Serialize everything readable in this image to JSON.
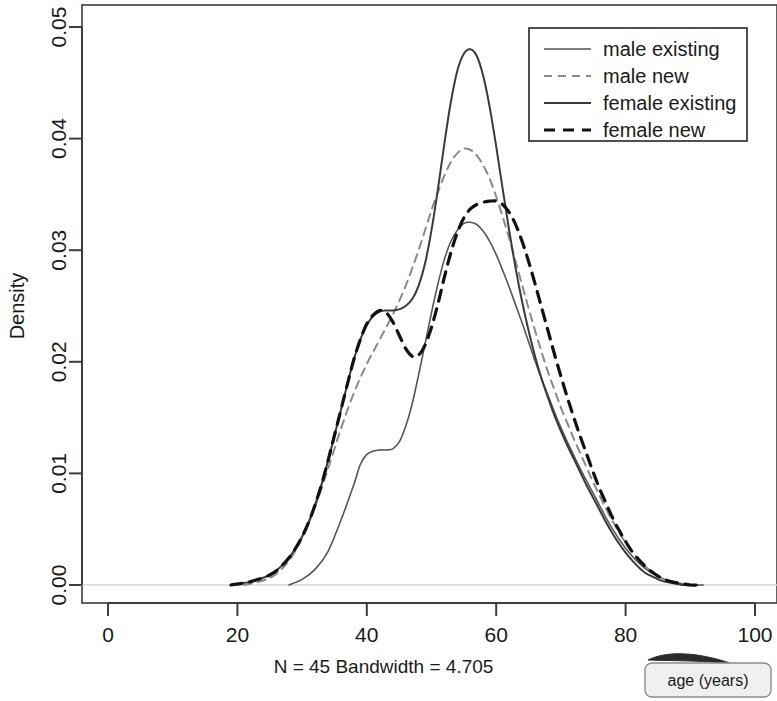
{
  "chart_data": {
    "type": "line",
    "title": "",
    "subtitle": "N = 45   Bandwidth = 4.705",
    "xlabel": "",
    "ylabel": "Density",
    "xlim": [
      0,
      100
    ],
    "ylim": [
      0.0,
      0.05
    ],
    "xticks": [
      0,
      20,
      40,
      60,
      80,
      100
    ],
    "xtick_labels": [
      "0",
      "20",
      "40",
      "60",
      "80",
      "100"
    ],
    "yticks": [
      0.0,
      0.01,
      0.02,
      0.03,
      0.04,
      0.05
    ],
    "ytick_labels": [
      "0.00",
      "0.01",
      "0.02",
      "0.03",
      "0.04",
      "0.05"
    ],
    "grid": false,
    "legend_position": "top-right",
    "series": [
      {
        "name": "male existing",
        "style": "solid",
        "color": "#555555",
        "width": 1.6,
        "points": [
          [
            28,
            0.0
          ],
          [
            30,
            0.0005
          ],
          [
            32,
            0.0014
          ],
          [
            34,
            0.003
          ],
          [
            36,
            0.0058
          ],
          [
            38,
            0.009
          ],
          [
            39,
            0.0108
          ],
          [
            40,
            0.0117
          ],
          [
            41,
            0.012
          ],
          [
            42,
            0.0121
          ],
          [
            43,
            0.0121
          ],
          [
            44,
            0.0122
          ],
          [
            45,
            0.0128
          ],
          [
            46,
            0.0142
          ],
          [
            47,
            0.0162
          ],
          [
            48,
            0.0188
          ],
          [
            49,
            0.0216
          ],
          [
            50,
            0.0244
          ],
          [
            51,
            0.027
          ],
          [
            52,
            0.0292
          ],
          [
            53,
            0.0308
          ],
          [
            54,
            0.0318
          ],
          [
            55,
            0.0324
          ],
          [
            56,
            0.0325
          ],
          [
            57,
            0.0323
          ],
          [
            58,
            0.0317
          ],
          [
            59,
            0.0308
          ],
          [
            60,
            0.0296
          ],
          [
            61,
            0.0282
          ],
          [
            62,
            0.0267
          ],
          [
            63,
            0.0251
          ],
          [
            64,
            0.0235
          ],
          [
            65,
            0.0218
          ],
          [
            66,
            0.0201
          ],
          [
            67,
            0.0185
          ],
          [
            68,
            0.017
          ],
          [
            69,
            0.0155
          ],
          [
            70,
            0.0141
          ],
          [
            71,
            0.0128
          ],
          [
            72,
            0.0116
          ],
          [
            73,
            0.0104
          ],
          [
            74,
            0.0093
          ],
          [
            75,
            0.0082
          ],
          [
            76,
            0.0071
          ],
          [
            77,
            0.006
          ],
          [
            78,
            0.005
          ],
          [
            79,
            0.0041
          ],
          [
            80,
            0.0033
          ],
          [
            81,
            0.0026
          ],
          [
            82,
            0.002
          ],
          [
            83,
            0.0015
          ],
          [
            84,
            0.0011
          ],
          [
            85,
            0.0008
          ],
          [
            86,
            0.0005
          ],
          [
            87,
            0.0003
          ],
          [
            88,
            0.0002
          ],
          [
            90,
            0.0
          ],
          [
            92,
            0.0
          ]
        ]
      },
      {
        "name": "male new",
        "style": "dashed",
        "color": "#8a8a8a",
        "width": 2.0,
        "points": [
          [
            21,
            0.0
          ],
          [
            24,
            0.0004
          ],
          [
            26,
            0.001
          ],
          [
            28,
            0.0022
          ],
          [
            30,
            0.0042
          ],
          [
            32,
            0.007
          ],
          [
            34,
            0.0104
          ],
          [
            36,
            0.014
          ],
          [
            38,
            0.0172
          ],
          [
            40,
            0.0198
          ],
          [
            42,
            0.022
          ],
          [
            44,
            0.0242
          ],
          [
            46,
            0.0268
          ],
          [
            48,
            0.03
          ],
          [
            50,
            0.0336
          ],
          [
            51,
            0.0352
          ],
          [
            52,
            0.0367
          ],
          [
            53,
            0.0379
          ],
          [
            54,
            0.0387
          ],
          [
            55,
            0.0391
          ],
          [
            56,
            0.039
          ],
          [
            57,
            0.0385
          ],
          [
            58,
            0.0376
          ],
          [
            59,
            0.0364
          ],
          [
            60,
            0.0348
          ],
          [
            61,
            0.033
          ],
          [
            62,
            0.0311
          ],
          [
            63,
            0.029
          ],
          [
            64,
            0.0269
          ],
          [
            65,
            0.0248
          ],
          [
            66,
            0.0228
          ],
          [
            67,
            0.0209
          ],
          [
            68,
            0.0191
          ],
          [
            69,
            0.0175
          ],
          [
            70,
            0.0159
          ],
          [
            71,
            0.0145
          ],
          [
            72,
            0.0131
          ],
          [
            73,
            0.0118
          ],
          [
            74,
            0.0105
          ],
          [
            75,
            0.0092
          ],
          [
            76,
            0.008
          ],
          [
            77,
            0.0068
          ],
          [
            78,
            0.0057
          ],
          [
            79,
            0.0047
          ],
          [
            80,
            0.0038
          ],
          [
            81,
            0.003
          ],
          [
            82,
            0.0023
          ],
          [
            83,
            0.0017
          ],
          [
            84,
            0.0012
          ],
          [
            85,
            0.0008
          ],
          [
            86,
            0.0005
          ],
          [
            87,
            0.0003
          ],
          [
            88,
            0.0002
          ],
          [
            90,
            0.0
          ],
          [
            91,
            0.0
          ]
        ]
      },
      {
        "name": "female existing",
        "style": "solid",
        "color": "#3a3a3a",
        "width": 2.0,
        "points": [
          [
            19,
            0.0
          ],
          [
            22,
            0.0003
          ],
          [
            25,
            0.0009
          ],
          [
            27,
            0.0018
          ],
          [
            29,
            0.0033
          ],
          [
            31,
            0.0056
          ],
          [
            33,
            0.009
          ],
          [
            35,
            0.0134
          ],
          [
            37,
            0.018
          ],
          [
            38,
            0.0202
          ],
          [
            39,
            0.022
          ],
          [
            40,
            0.0233
          ],
          [
            41,
            0.0241
          ],
          [
            42,
            0.0245
          ],
          [
            43,
            0.0246
          ],
          [
            44,
            0.0246
          ],
          [
            45,
            0.0247
          ],
          [
            46,
            0.025
          ],
          [
            47,
            0.0256
          ],
          [
            48,
            0.0268
          ],
          [
            49,
            0.0288
          ],
          [
            50,
            0.0318
          ],
          [
            51,
            0.0355
          ],
          [
            52,
            0.0396
          ],
          [
            53,
            0.0433
          ],
          [
            54,
            0.0461
          ],
          [
            55,
            0.0476
          ],
          [
            56,
            0.048
          ],
          [
            57,
            0.0474
          ],
          [
            58,
            0.0456
          ],
          [
            59,
            0.0428
          ],
          [
            60,
            0.0393
          ],
          [
            61,
            0.0355
          ],
          [
            62,
            0.0318
          ],
          [
            63,
            0.0284
          ],
          [
            64,
            0.0254
          ],
          [
            65,
            0.0228
          ],
          [
            66,
            0.0205
          ],
          [
            67,
            0.0185
          ],
          [
            68,
            0.0168
          ],
          [
            69,
            0.0152
          ],
          [
            70,
            0.0138
          ],
          [
            71,
            0.0125
          ],
          [
            72,
            0.0113
          ],
          [
            73,
            0.0101
          ],
          [
            74,
            0.0089
          ],
          [
            75,
            0.0078
          ],
          [
            76,
            0.0067
          ],
          [
            77,
            0.0056
          ],
          [
            78,
            0.0046
          ],
          [
            79,
            0.0037
          ],
          [
            80,
            0.0029
          ],
          [
            81,
            0.0022
          ],
          [
            82,
            0.0016
          ],
          [
            83,
            0.0011
          ],
          [
            84,
            0.0008
          ],
          [
            85,
            0.0005
          ],
          [
            86,
            0.0003
          ],
          [
            87,
            0.0002
          ],
          [
            89,
            0.0
          ],
          [
            91,
            0.0
          ]
        ]
      },
      {
        "name": "female new",
        "style": "dashed",
        "color": "#111111",
        "width": 3.2,
        "points": [
          [
            19,
            0.0
          ],
          [
            22,
            0.0003
          ],
          [
            25,
            0.0009
          ],
          [
            27,
            0.0018
          ],
          [
            29,
            0.0033
          ],
          [
            31,
            0.0056
          ],
          [
            33,
            0.009
          ],
          [
            35,
            0.0134
          ],
          [
            37,
            0.018
          ],
          [
            38,
            0.0202
          ],
          [
            39,
            0.022
          ],
          [
            40,
            0.0234
          ],
          [
            41,
            0.0242
          ],
          [
            42,
            0.0246
          ],
          [
            43,
            0.0244
          ],
          [
            44,
            0.0236
          ],
          [
            45,
            0.0224
          ],
          [
            46,
            0.0212
          ],
          [
            47,
            0.0205
          ],
          [
            48,
            0.0206
          ],
          [
            49,
            0.0215
          ],
          [
            50,
            0.0231
          ],
          [
            51,
            0.0252
          ],
          [
            52,
            0.0276
          ],
          [
            53,
            0.0298
          ],
          [
            54,
            0.0316
          ],
          [
            55,
            0.0329
          ],
          [
            56,
            0.0337
          ],
          [
            57,
            0.0341
          ],
          [
            58,
            0.0343
          ],
          [
            59,
            0.0344
          ],
          [
            60,
            0.0344
          ],
          [
            61,
            0.0341
          ],
          [
            62,
            0.0334
          ],
          [
            63,
            0.0323
          ],
          [
            64,
            0.0308
          ],
          [
            65,
            0.029
          ],
          [
            66,
            0.027
          ],
          [
            67,
            0.0249
          ],
          [
            68,
            0.0228
          ],
          [
            69,
            0.0207
          ],
          [
            70,
            0.0187
          ],
          [
            71,
            0.0168
          ],
          [
            72,
            0.015
          ],
          [
            73,
            0.0133
          ],
          [
            74,
            0.0117
          ],
          [
            75,
            0.0101
          ],
          [
            76,
            0.0086
          ],
          [
            77,
            0.0073
          ],
          [
            78,
            0.006
          ],
          [
            79,
            0.0049
          ],
          [
            80,
            0.0039
          ],
          [
            81,
            0.003
          ],
          [
            82,
            0.0023
          ],
          [
            83,
            0.0017
          ],
          [
            84,
            0.0012
          ],
          [
            85,
            0.0008
          ],
          [
            86,
            0.0005
          ],
          [
            87,
            0.0003
          ],
          [
            88,
            0.0002
          ],
          [
            90,
            0.0
          ],
          [
            91,
            0.0
          ]
        ]
      }
    ]
  },
  "annotation": {
    "label": "age (years)"
  },
  "colors": {
    "axis": "#3d3d3d",
    "baseline": "#d8d8d8",
    "legend_border": "#3d3d3d",
    "callout_fill": "#f0f0f0",
    "callout_border": "#8c8c8c"
  }
}
